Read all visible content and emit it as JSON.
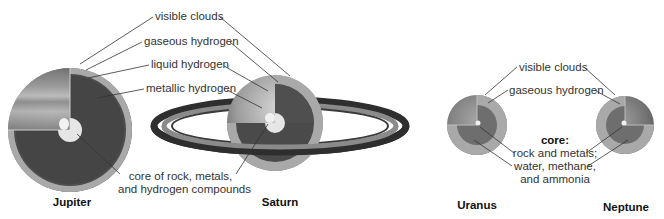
{
  "diagram": {
    "type": "planet-interior-cutaway",
    "planets": [
      {
        "name": "Jupiter",
        "cx": 70,
        "cy": 130,
        "r": 62
      },
      {
        "name": "Saturn",
        "cx": 275,
        "cy": 123,
        "r": 48
      },
      {
        "name": "Uranus",
        "cx": 477,
        "cy": 125,
        "r": 30
      },
      {
        "name": "Neptune",
        "cx": 625,
        "cy": 125,
        "r": 29
      }
    ],
    "jovian_labels": {
      "visible_clouds": "visible clouds",
      "gaseous_hydrogen": "gaseous hydrogen",
      "liquid_hydrogen": "liquid hydrogen",
      "metallic_hydrogen": "metallic hydrogen",
      "core_line1": "core of rock, metals,",
      "core_line2": "and hydrogen compounds"
    },
    "ice_giant_labels": {
      "visible_clouds": "visible clouds",
      "gaseous_hydrogen": "gaseous hydrogen",
      "core_title": "core:",
      "core_line1": "rock and metals;",
      "core_line2": "water, methane,",
      "core_line3": "and ammonia"
    },
    "colors": {
      "outer_shell": "#8c8c8c",
      "gaseous_layer": "#a9a9a9",
      "liquid_layer": "#9a9a9a",
      "metallic_layer": "#4a4a4a",
      "core": "#e6e6e6",
      "ring_dark": "#2e2e2e",
      "ring_light": "#8a8a8a",
      "leader_line": "#333333"
    }
  }
}
